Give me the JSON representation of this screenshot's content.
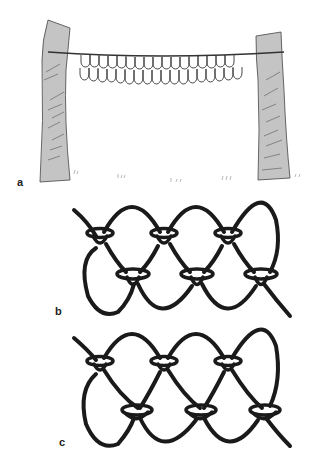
{
  "figure": {
    "panels": [
      {
        "id": "a",
        "label": "a",
        "description": "Net hung on a cord tied between two tree trunks, two rows of scalloped loops"
      },
      {
        "id": "b",
        "label": "b",
        "description": "Close-up of netting knots: two rows of loops joined by knots"
      },
      {
        "id": "c",
        "label": "c",
        "description": "Close-up of netting knots with a different knot tying variant"
      }
    ],
    "panel_a": {
      "top_row_loops": 17,
      "bottom_row_loops": 18
    },
    "colors": {
      "ink": "#1a1a1a",
      "bark": "#c4c4c4",
      "bark_line": "#555555",
      "background": "#ffffff"
    }
  }
}
